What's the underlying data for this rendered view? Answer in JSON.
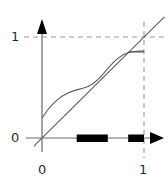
{
  "figure": {
    "title": "",
    "axis_labels": {
      "y_one": "1",
      "y_zero": "0",
      "x_zero": "0",
      "x_one": "1"
    },
    "colors": {
      "axis": "#555555",
      "curve": "#555555",
      "diagonal": "#555555",
      "dashed": "#999999",
      "interval": "#000000",
      "text": "#2b2b2b",
      "background": "#ffffff"
    }
  },
  "chart_data": {
    "type": "line",
    "title": "",
    "xlabel": "",
    "ylabel": "",
    "xlim": [
      -0.08,
      1.2
    ],
    "ylim": [
      -0.08,
      1.18
    ],
    "xticks": [
      0,
      1
    ],
    "xticklabels": [
      "0",
      "1"
    ],
    "yticks": [
      0,
      1
    ],
    "yticklabels": [
      "0",
      "1"
    ],
    "grid": false,
    "legend": null,
    "series": [
      {
        "name": "f(x)",
        "style": "solid",
        "x": [
          0.0,
          0.05,
          0.1,
          0.15,
          0.2,
          0.25,
          0.3,
          0.35,
          0.4,
          0.45,
          0.5,
          0.55,
          0.6,
          0.65,
          0.7,
          0.75,
          0.8,
          0.85,
          0.9,
          0.95,
          1.0
        ],
        "y": [
          0.198,
          0.27,
          0.33,
          0.378,
          0.416,
          0.444,
          0.464,
          0.479,
          0.492,
          0.509,
          0.537,
          0.58,
          0.635,
          0.694,
          0.748,
          0.793,
          0.826,
          0.847,
          0.857,
          0.86,
          0.86
        ]
      },
      {
        "name": "y = x",
        "style": "solid",
        "x": [
          -0.08,
          1.2
        ],
        "y": [
          -0.08,
          1.2
        ]
      }
    ],
    "reference_lines": [
      {
        "name": "y = 1",
        "orientation": "horizontal",
        "value": 1,
        "style": "dashed"
      },
      {
        "name": "x = 1",
        "orientation": "vertical",
        "value": 1,
        "style": "dashed"
      }
    ],
    "annotations": [
      {
        "name": "interval-marker-1",
        "type": "x-interval",
        "start": 0.34,
        "end": 0.645,
        "y": 0
      },
      {
        "name": "interval-marker-2",
        "type": "x-interval",
        "start": 0.845,
        "end": 1.0,
        "y": 0
      }
    ]
  }
}
